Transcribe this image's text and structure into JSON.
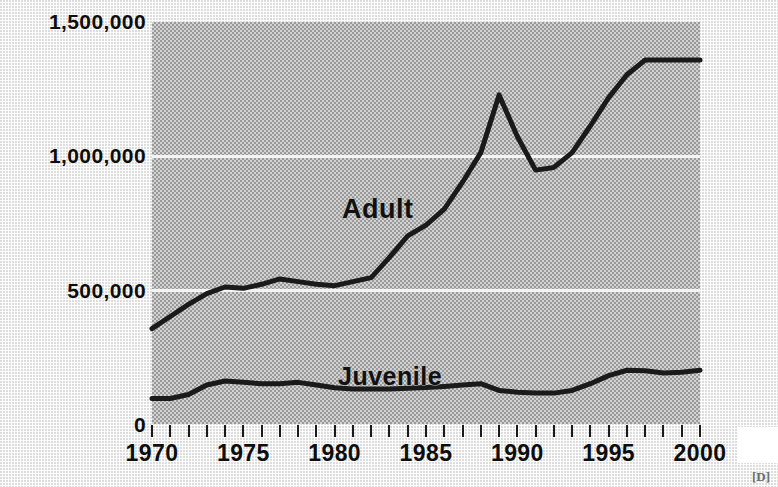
{
  "chart_data": {
    "type": "line",
    "title": "",
    "subtitle": "",
    "xlabel": "",
    "ylabel": "",
    "xlim": [
      1970,
      2000
    ],
    "ylim": [
      0,
      1500000
    ],
    "grid": true,
    "gridlines_y": [
      0,
      500000,
      1000000,
      1500000
    ],
    "legend_position": "inline-annotation",
    "x": [
      1970,
      1971,
      1972,
      1973,
      1974,
      1975,
      1976,
      1977,
      1978,
      1979,
      1980,
      1981,
      1982,
      1983,
      1984,
      1985,
      1986,
      1987,
      1988,
      1989,
      1990,
      1991,
      1992,
      1993,
      1994,
      1995,
      1996,
      1997,
      1998,
      1999,
      2000
    ],
    "x_tick_labels": [
      "1970",
      "1975",
      "1980",
      "1985",
      "1990",
      "1995",
      "2000"
    ],
    "x_tick_values": [
      1970,
      1975,
      1980,
      1985,
      1990,
      1995,
      2000
    ],
    "x_minor_tick_interval": 1,
    "y_tick_labels": [
      "1,500,000",
      "1,000,000",
      "500,000",
      "0"
    ],
    "y_tick_values": [
      1500000,
      1000000,
      500000,
      0
    ],
    "series": [
      {
        "name": "Adult",
        "label": "Adult",
        "color": "#1a1a1a",
        "values": [
          355000,
          400000,
          445000,
          485000,
          510000,
          505000,
          520000,
          540000,
          530000,
          520000,
          515000,
          530000,
          545000,
          620000,
          700000,
          740000,
          800000,
          900000,
          1010000,
          1225000,
          1070000,
          945000,
          955000,
          1010000,
          1110000,
          1215000,
          1300000,
          1355000,
          1355000,
          1355000,
          1355000
        ]
      },
      {
        "name": "Juvenile",
        "label": "Juvenile",
        "color": "#1a1a1a",
        "values": [
          95000,
          95000,
          110000,
          145000,
          160000,
          155000,
          150000,
          150000,
          155000,
          145000,
          135000,
          130000,
          130000,
          130000,
          133000,
          136000,
          140000,
          145000,
          150000,
          125000,
          118000,
          115000,
          115000,
          125000,
          150000,
          180000,
          200000,
          198000,
          190000,
          193000,
          200000
        ]
      }
    ],
    "annotations": [
      {
        "name": "adult-label",
        "text": "Adult",
        "x": 1983.5,
        "y": 830000
      },
      {
        "name": "juvenile-label",
        "text": "Juvenile",
        "x": 1983.2,
        "y": 245000
      }
    ]
  },
  "axes": {
    "y_labels": [
      "1,500,000",
      "1,000,000",
      "500,000",
      "0"
    ],
    "x_labels": [
      "1970",
      "1975",
      "1980",
      "1985",
      "1990",
      "1995",
      "2000"
    ]
  },
  "labels": {
    "adult": "Adult",
    "juvenile": "Juvenile"
  },
  "footer": {
    "corner_fragment": "[D]"
  },
  "colors": {
    "plot_background": "#b9b9b9",
    "line": "#1a1a1a",
    "gridline": "#f4f4f4",
    "page_background": "#fdfdfd",
    "text": "#0d0d0d"
  }
}
